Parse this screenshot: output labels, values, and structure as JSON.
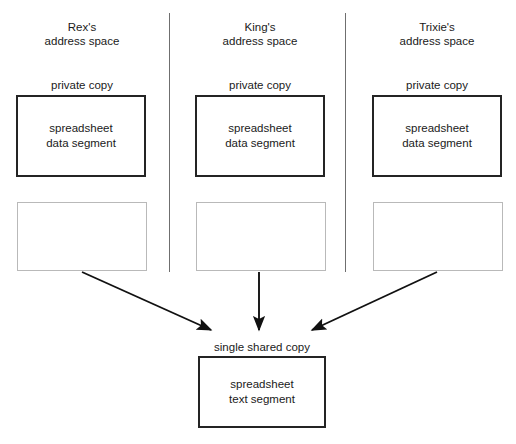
{
  "diagram": {
    "width": 516,
    "height": 444,
    "colors": {
      "background": "#ffffff",
      "box_border": "#242424",
      "empty_box_border": "#b9b9b9",
      "divider": "#6f6f6f",
      "text": "#1a1a1a",
      "arrow": "#111111"
    }
  },
  "columns": [
    {
      "id": "rex",
      "header": "Rex's\naddress space",
      "private_label": "private copy",
      "segment_text": "spreadsheet\ndata segment",
      "empty_region_label": ""
    },
    {
      "id": "king",
      "header": "King's\naddress space",
      "private_label": "private copy",
      "segment_text": "spreadsheet\ndata segment",
      "empty_region_label": ""
    },
    {
      "id": "trixie",
      "header": "Trixie's\naddress space",
      "private_label": "private copy",
      "segment_text": "spreadsheet\ndata segment",
      "empty_region_label": ""
    }
  ],
  "shared": {
    "label": "single shared copy",
    "segment_text": "spreadsheet\ntext segment"
  },
  "arrows": [
    {
      "id": "rex-to-shared",
      "from": "rex-empty-box",
      "to": "shared-text-segment"
    },
    {
      "id": "king-to-shared",
      "from": "king-empty-box",
      "to": "shared-text-segment"
    },
    {
      "id": "trixie-to-shared",
      "from": "trixie-empty-box",
      "to": "shared-text-segment"
    }
  ]
}
